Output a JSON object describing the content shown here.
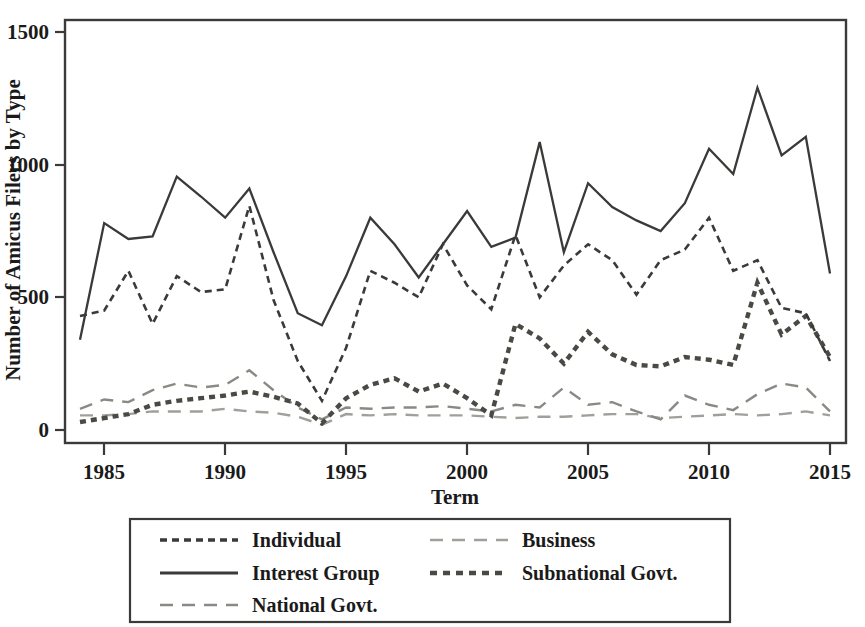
{
  "chart_data": {
    "type": "line",
    "title": "",
    "xlabel": "Term",
    "ylabel": "Number of Amicus Filers by Type",
    "xlim": [
      1984,
      2015
    ],
    "ylim": [
      0,
      1500
    ],
    "xticks": [
      1985,
      1990,
      1995,
      2000,
      2005,
      2010,
      2015
    ],
    "yticks": [
      0,
      500,
      1000,
      1500
    ],
    "grid": false,
    "legend_position": "below-plot",
    "x": [
      1984,
      1985,
      1986,
      1987,
      1988,
      1989,
      1990,
      1991,
      1992,
      1993,
      1994,
      1995,
      1996,
      1997,
      1998,
      1999,
      2000,
      2001,
      2002,
      2003,
      2004,
      2005,
      2006,
      2007,
      2008,
      2009,
      2010,
      2011,
      2012,
      2013,
      2014,
      2015
    ],
    "series": [
      {
        "name": "Individual",
        "style": "fine-dotted",
        "color": "#3a3a38",
        "values": [
          430,
          450,
          600,
          400,
          580,
          520,
          530,
          845,
          490,
          260,
          110,
          310,
          600,
          555,
          500,
          700,
          545,
          455,
          735,
          500,
          620,
          700,
          640,
          510,
          640,
          680,
          800,
          600,
          640,
          460,
          440,
          260
        ]
      },
      {
        "name": "Interest Group",
        "style": "solid",
        "color": "#3a3a38",
        "values": [
          340,
          780,
          720,
          730,
          955,
          880,
          800,
          910,
          670,
          440,
          395,
          580,
          800,
          700,
          575,
          700,
          825,
          690,
          725,
          1085,
          670,
          930,
          840,
          790,
          750,
          855,
          1060,
          965,
          1290,
          1035,
          1105,
          590
        ]
      },
      {
        "name": "National Govt.",
        "style": "long-dashed",
        "color": "#8a8a85",
        "values": [
          80,
          115,
          105,
          150,
          175,
          160,
          170,
          225,
          150,
          85,
          40,
          85,
          80,
          85,
          85,
          90,
          80,
          70,
          95,
          85,
          160,
          95,
          105,
          70,
          40,
          130,
          95,
          75,
          135,
          175,
          160,
          70
        ]
      },
      {
        "name": "Business",
        "style": "long-dashed",
        "color": "#a0a09a",
        "values": [
          55,
          55,
          60,
          70,
          70,
          70,
          80,
          70,
          65,
          50,
          20,
          60,
          55,
          60,
          55,
          55,
          55,
          50,
          45,
          50,
          50,
          55,
          60,
          60,
          45,
          50,
          55,
          60,
          55,
          60,
          70,
          55
        ]
      },
      {
        "name": "Subnational Govt.",
        "style": "thick-dotted",
        "color": "#4a4a45",
        "values": [
          30,
          45,
          60,
          95,
          110,
          120,
          130,
          145,
          125,
          100,
          25,
          120,
          170,
          195,
          145,
          175,
          120,
          55,
          400,
          345,
          250,
          370,
          285,
          245,
          240,
          275,
          265,
          245,
          555,
          360,
          430,
          275
        ]
      }
    ]
  },
  "legend": {
    "entries": [
      {
        "label": "Individual",
        "style": "fine-dotted"
      },
      {
        "label": "Business",
        "style": "long-dashed-light"
      },
      {
        "label": "Interest Group",
        "style": "solid"
      },
      {
        "label": "Subnational Govt.",
        "style": "thick-dotted"
      },
      {
        "label": "National Govt.",
        "style": "long-dashed"
      }
    ]
  },
  "axes": {
    "y_tick_labels": [
      "0",
      "500",
      "1000",
      "1500"
    ],
    "x_tick_labels": [
      "1985",
      "1990",
      "1995",
      "2000",
      "2005",
      "2010",
      "2015"
    ],
    "x_title": "Term",
    "y_title": "Number of Amicus Filers by Type"
  }
}
